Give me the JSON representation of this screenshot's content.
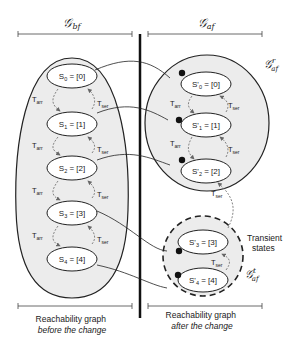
{
  "header": {
    "left_graph": "𝒢",
    "left_sub": "bf",
    "right_graph": "𝒢",
    "right_sub": "af"
  },
  "left": {
    "states": [
      "S0 = [0]",
      "S1 = [1]",
      "S2 = [2]",
      "S3 = [3]",
      "S4 = [4]"
    ],
    "state_labels": [
      {
        "name": "S",
        "sub": "0",
        "val": " = [0]"
      },
      {
        "name": "S",
        "sub": "1",
        "val": " = [1]"
      },
      {
        "name": "S",
        "sub": "2",
        "val": " = [2]"
      },
      {
        "name": "S",
        "sub": "3",
        "val": " = [3]"
      },
      {
        "name": "S",
        "sub": "4",
        "val": " = [4]"
      }
    ],
    "caption_line1": "Reachability graph",
    "caption_line2": "before the change"
  },
  "right": {
    "state_labels": [
      {
        "name": "S'",
        "sub": "0",
        "val": " = [0]"
      },
      {
        "name": "S'",
        "sub": "1",
        "val": " = [1]"
      },
      {
        "name": "S'",
        "sub": "2",
        "val": " = [2]"
      },
      {
        "name": "S'",
        "sub": "3",
        "val": " = [3]"
      },
      {
        "name": "S'",
        "sub": "4",
        "val": " = [4]"
      }
    ],
    "subgraph_stable": {
      "graph": "𝒢",
      "sup": "r",
      "sub": "af"
    },
    "subgraph_transient": {
      "graph": "𝒢",
      "sup": "t",
      "sub": "af"
    },
    "transient_line1": "Transient",
    "transient_line2": "states",
    "caption_line1": "Reachability graph",
    "caption_line2": "after the change"
  },
  "transitions": {
    "arrival": {
      "name": "T",
      "sub": "arr"
    },
    "service": {
      "name": "T",
      "sub": "ser"
    }
  },
  "colors": {
    "region_fill": "#ececec",
    "stroke": "#222222",
    "dashed_arrow": "#777777"
  }
}
